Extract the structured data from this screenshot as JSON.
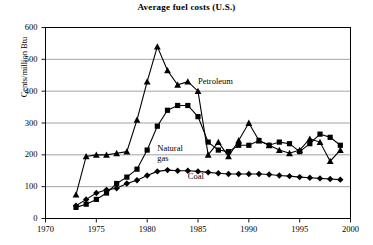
{
  "chart_data": {
    "type": "line",
    "title": "Average fuel costs (U.S.)",
    "xlabel": "",
    "ylabel": "Cents/million Btu",
    "xlim": [
      1970,
      2000
    ],
    "ylim": [
      0,
      600
    ],
    "xticks": [
      1970,
      1975,
      1980,
      1985,
      1990,
      1995,
      2000
    ],
    "yticks": [
      0,
      100,
      200,
      300,
      400,
      500,
      600
    ],
    "grid": "horizontal",
    "legend": "inline-annotations",
    "series": [
      {
        "name": "Petroleum",
        "marker": "triangle",
        "color": "#000000",
        "label_x": 1985.0,
        "label_y": 425,
        "x": [
          1973,
          1974,
          1975,
          1976,
          1977,
          1978,
          1979,
          1980,
          1981,
          1982,
          1983,
          1984,
          1985,
          1986,
          1987,
          1988,
          1989,
          1990,
          1991,
          1992,
          1993,
          1994,
          1995,
          1996,
          1997,
          1998,
          1999
        ],
        "values": [
          75,
          195,
          200,
          200,
          205,
          210,
          310,
          430,
          540,
          465,
          420,
          430,
          400,
          200,
          240,
          195,
          245,
          300,
          245,
          230,
          215,
          205,
          215,
          250,
          240,
          180,
          215
        ]
      },
      {
        "name": "Natural gas",
        "marker": "square",
        "color": "#000000",
        "label_x": 1981.0,
        "label_y": 215,
        "label_line2": "gas",
        "x": [
          1973,
          1974,
          1975,
          1976,
          1977,
          1978,
          1979,
          1980,
          1981,
          1982,
          1983,
          1984,
          1985,
          1986,
          1987,
          1988,
          1989,
          1990,
          1991,
          1992,
          1993,
          1994,
          1995,
          1996,
          1997,
          1998,
          1999
        ],
        "values": [
          35,
          45,
          60,
          80,
          110,
          130,
          155,
          215,
          290,
          340,
          355,
          355,
          320,
          240,
          215,
          210,
          230,
          230,
          245,
          230,
          240,
          235,
          210,
          235,
          265,
          255,
          230
        ]
      },
      {
        "name": "Coal",
        "marker": "diamond",
        "color": "#000000",
        "label_x": 1984.0,
        "label_y": 128,
        "x": [
          1973,
          1974,
          1975,
          1976,
          1977,
          1978,
          1979,
          1980,
          1981,
          1982,
          1983,
          1984,
          1985,
          1986,
          1987,
          1988,
          1989,
          1990,
          1991,
          1992,
          1993,
          1994,
          1995,
          1996,
          1997,
          1998,
          1999
        ],
        "values": [
          40,
          60,
          80,
          90,
          95,
          110,
          120,
          135,
          148,
          152,
          150,
          150,
          148,
          145,
          142,
          140,
          140,
          140,
          140,
          138,
          135,
          133,
          130,
          128,
          126,
          124,
          122
        ]
      }
    ]
  },
  "axis": {
    "y_title": "Cents/million Btu",
    "y_tick_labels": [
      "0",
      "100",
      "200",
      "300",
      "400",
      "500",
      "600"
    ],
    "x_tick_labels": [
      "1970",
      "1975",
      "1980",
      "1985",
      "1990",
      "1995",
      "2000"
    ]
  },
  "annotations": {
    "petroleum": "Petroleum",
    "natural_gas_line1": "Natural",
    "natural_gas_line2": "gas",
    "coal": "Coal"
  }
}
